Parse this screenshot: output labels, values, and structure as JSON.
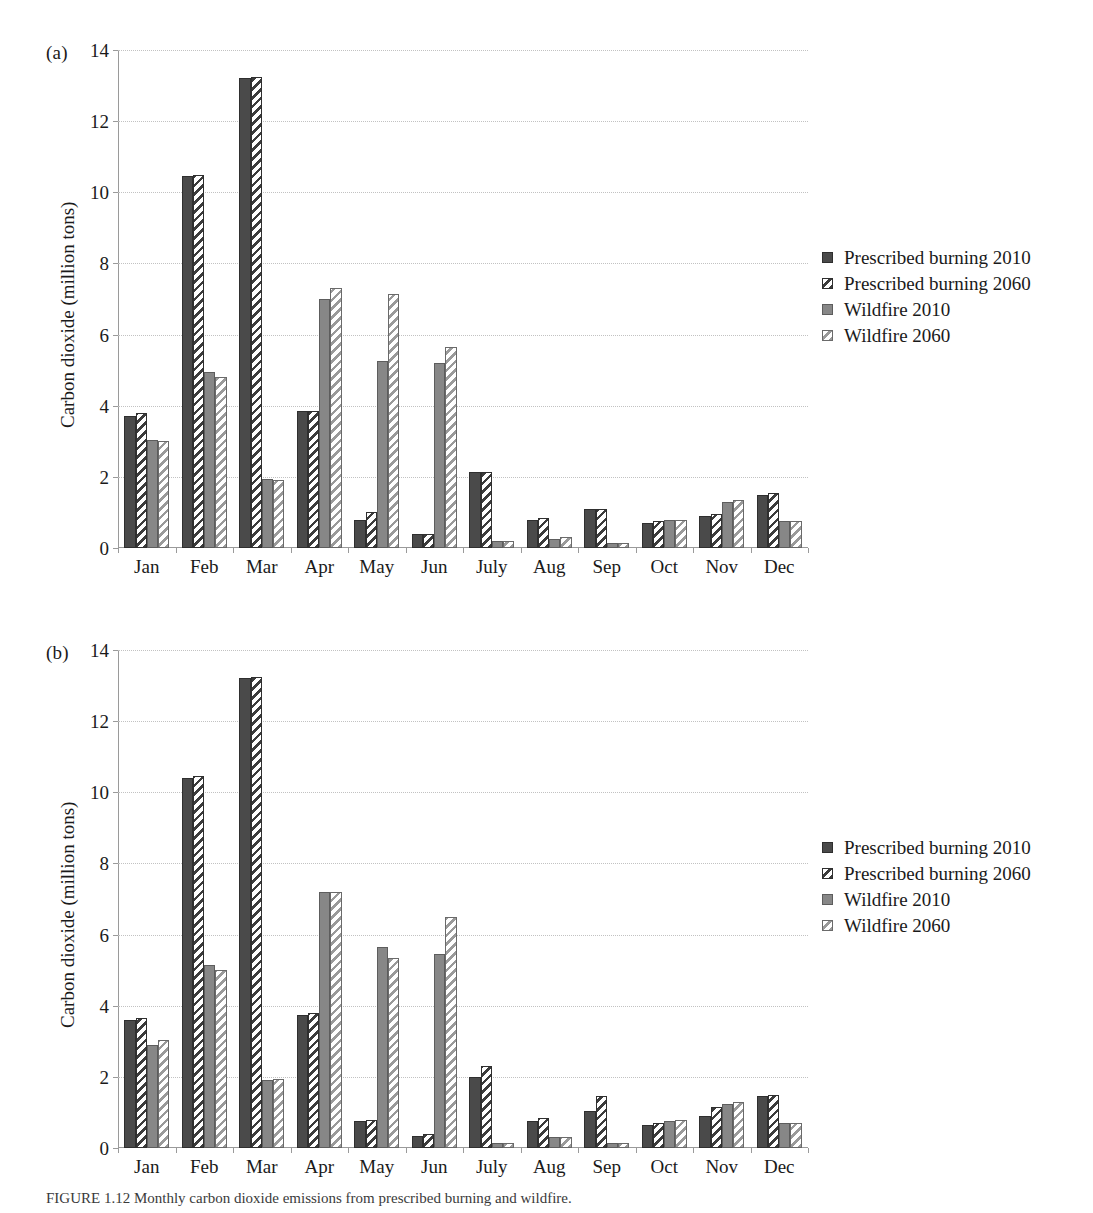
{
  "figure": {
    "caption_prefix": "FIGURE",
    "caption_text": "FIGURE 1.12 Monthly carbon dioxide emissions from prescribed burning and wildfire."
  },
  "panels": [
    {
      "key": "a",
      "label": "(a)",
      "ylabel": "Carbon dioxide (million tons)",
      "legend": [
        {
          "name": "Prescribed burning 2010",
          "swatch": "dark-solid"
        },
        {
          "name": "Prescribed burning 2060",
          "swatch": "dark-hatched"
        },
        {
          "name": "Wildfire 2010",
          "swatch": "gray-solid"
        },
        {
          "name": "Wildfire 2060",
          "swatch": "gray-hatched"
        }
      ]
    },
    {
      "key": "b",
      "label": "(b)",
      "ylabel": "Carbon dioxide (million tons)",
      "legend": [
        {
          "name": "Prescribed burning 2010",
          "swatch": "dark-solid"
        },
        {
          "name": "Prescribed burning 2060",
          "swatch": "dark-hatched"
        },
        {
          "name": "Wildfire 2010",
          "swatch": "gray-solid"
        },
        {
          "name": "Wildfire 2060",
          "swatch": "gray-hatched"
        }
      ]
    }
  ],
  "chart_data": [
    {
      "type": "bar",
      "panel": "a",
      "title": "(a)",
      "xlabel": "",
      "ylabel": "Carbon dioxide (million tons)",
      "ylim": [
        0,
        14
      ],
      "yticks": [
        0,
        2,
        4,
        6,
        8,
        10,
        12,
        14
      ],
      "ytick_labels": [
        "0",
        "2",
        "4",
        "6",
        "8",
        "10",
        "12",
        "14"
      ],
      "grid": true,
      "legend_position": "right",
      "categories": [
        "Jan",
        "Feb",
        "Mar",
        "Apr",
        "May",
        "Jun",
        "July",
        "Aug",
        "Sep",
        "Oct",
        "Nov",
        "Dec"
      ],
      "series": [
        {
          "name": "Prescribed burning 2010",
          "color": "#4a4a4a",
          "pattern": "solid",
          "values": [
            3.7,
            10.45,
            13.2,
            3.85,
            0.8,
            0.4,
            2.15,
            0.8,
            1.1,
            0.7,
            0.9,
            1.5
          ]
        },
        {
          "name": "Prescribed burning 2060",
          "color": "#3c3c3c",
          "pattern": "hatched",
          "values": [
            3.8,
            10.5,
            13.25,
            3.85,
            1.0,
            0.4,
            2.15,
            0.85,
            1.1,
            0.75,
            0.95,
            1.55
          ]
        },
        {
          "name": "Wildfire 2010",
          "color": "#878787",
          "pattern": "solid",
          "values": [
            3.05,
            4.95,
            1.95,
            7.0,
            5.25,
            5.2,
            0.2,
            0.25,
            0.15,
            0.8,
            1.3,
            0.75
          ]
        },
        {
          "name": "Wildfire 2060",
          "color": "#9a9a9a",
          "pattern": "hatched",
          "values": [
            3.0,
            4.8,
            1.9,
            7.3,
            7.15,
            5.65,
            0.2,
            0.3,
            0.15,
            0.8,
            1.35,
            0.75
          ]
        }
      ]
    },
    {
      "type": "bar",
      "panel": "b",
      "title": "(b)",
      "xlabel": "",
      "ylabel": "Carbon dioxide (million tons)",
      "ylim": [
        0,
        14
      ],
      "yticks": [
        0,
        2,
        4,
        6,
        8,
        10,
        12,
        14
      ],
      "ytick_labels": [
        "0",
        "2",
        "4",
        "6",
        "8",
        "10",
        "12",
        "14"
      ],
      "grid": true,
      "legend_position": "right",
      "categories": [
        "Jan",
        "Feb",
        "Mar",
        "Apr",
        "May",
        "Jun",
        "July",
        "Aug",
        "Sep",
        "Oct",
        "Nov",
        "Dec"
      ],
      "series": [
        {
          "name": "Prescribed burning 2010",
          "color": "#4a4a4a",
          "pattern": "solid",
          "values": [
            3.6,
            10.4,
            13.2,
            3.75,
            0.75,
            0.35,
            2.0,
            0.75,
            1.05,
            0.65,
            0.9,
            1.45
          ]
        },
        {
          "name": "Prescribed burning 2060",
          "color": "#3c3c3c",
          "pattern": "hatched",
          "values": [
            3.65,
            10.45,
            13.25,
            3.8,
            0.8,
            0.4,
            2.3,
            0.85,
            1.45,
            0.7,
            1.15,
            1.5
          ]
        },
        {
          "name": "Wildfire 2010",
          "color": "#878787",
          "pattern": "solid",
          "values": [
            2.9,
            5.15,
            1.9,
            7.2,
            5.65,
            5.45,
            0.15,
            0.3,
            0.15,
            0.75,
            1.25,
            0.7
          ]
        },
        {
          "name": "Wildfire 2060",
          "color": "#9a9a9a",
          "pattern": "hatched",
          "values": [
            3.05,
            5.0,
            1.95,
            7.2,
            5.35,
            6.5,
            0.15,
            0.3,
            0.15,
            0.8,
            1.3,
            0.7
          ]
        }
      ]
    }
  ]
}
